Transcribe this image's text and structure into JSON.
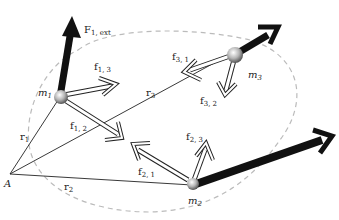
{
  "diagram": {
    "type": "particle-system-forces",
    "colors": {
      "background": "#ffffff",
      "external_force": "#111111",
      "internal_force_outline": "#222222",
      "internal_force_fill": "#ffffff",
      "boundary": "#bbbbbb",
      "position_line": "#222222"
    },
    "origin": {
      "id": "A",
      "label": "A"
    },
    "particles": [
      {
        "id": "m1",
        "label": "m",
        "sub": "1"
      },
      {
        "id": "m2",
        "label": "m",
        "sub": "2"
      },
      {
        "id": "m3",
        "label": "m",
        "sub": "3"
      }
    ],
    "position_vectors": [
      {
        "from": "A",
        "to": "m1",
        "label": "r",
        "sub": "1"
      },
      {
        "from": "A",
        "to": "m2",
        "label": "r",
        "sub": "2"
      },
      {
        "from": "A",
        "to": "m3",
        "label": "r",
        "sub": "3"
      }
    ],
    "external_forces": [
      {
        "on": "m1",
        "label": "F",
        "sub": "1, ext"
      },
      {
        "on": "m2",
        "label": "",
        "sub": ""
      },
      {
        "on": "m3",
        "label": "",
        "sub": ""
      }
    ],
    "internal_forces": [
      {
        "on": "m1",
        "by": "m3",
        "label": "f",
        "sub": "1, 3"
      },
      {
        "on": "m1",
        "by": "m2",
        "label": "f",
        "sub": "1, 2"
      },
      {
        "on": "m2",
        "by": "m1",
        "label": "f",
        "sub": "2, 1"
      },
      {
        "on": "m2",
        "by": "m3",
        "label": "f",
        "sub": "2, 3"
      },
      {
        "on": "m3",
        "by": "m1",
        "label": "f",
        "sub": "3, 1"
      },
      {
        "on": "m3",
        "by": "m2",
        "label": "f",
        "sub": "3, 2"
      }
    ]
  }
}
